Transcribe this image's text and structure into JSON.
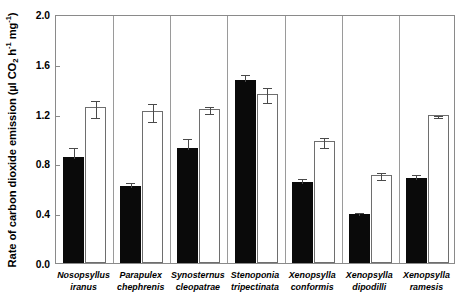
{
  "chart_data": {
    "type": "bar",
    "title": "",
    "xlabel": "",
    "ylabel": "Rate of carbon dioxide emission  (µl CO2 h-1 mg-1)",
    "ylabel_parts": {
      "prefix": "Rate of carbon dioxide emission  (",
      "mu": "µ",
      "l": "l CO",
      "sub2": "2",
      "h": " h",
      "sup1": "-1",
      "mg": " mg",
      "sup2": "-1",
      "suffix": ")"
    },
    "ylim": [
      0.0,
      2.0
    ],
    "yticks": [
      0.0,
      0.4,
      0.8,
      1.2,
      1.6,
      2.0
    ],
    "ytick_labels": [
      "0.0",
      "0.4",
      "0.8",
      "1.2",
      "1.6",
      "2.0"
    ],
    "grid": false,
    "legend": "none",
    "categories": [
      "Nosopsyllus iranus",
      "Parapulex chephrenis",
      "Synosternus cleopatrae",
      "Stenoponia tripectinata",
      "Xenopsylla conformis",
      "Xenopsylla dipodilli",
      "Xenopsylla ramesis"
    ],
    "category_lines": [
      [
        "Nosopsyllus",
        "iranus"
      ],
      [
        "Parapulex",
        "chephrenis"
      ],
      [
        "Synosternus",
        "cleopatrae"
      ],
      [
        "Stenoponia",
        "tripectinata"
      ],
      [
        "Xenopsylla",
        "conformis"
      ],
      [
        "Xenopsylla",
        "dipodilli"
      ],
      [
        "Xenopsylla",
        "ramesis"
      ]
    ],
    "series": [
      {
        "name": "filled",
        "fill": "#0a0a0a",
        "values": [
          0.85,
          0.62,
          0.92,
          1.47,
          0.65,
          0.39,
          0.68
        ],
        "errors": [
          0.09,
          0.04,
          0.09,
          0.06,
          0.04,
          0.03,
          0.04
        ]
      },
      {
        "name": "open",
        "fill": "#ffffff",
        "values": [
          1.25,
          1.22,
          1.24,
          1.36,
          0.98,
          0.71,
          1.19
        ],
        "errors": [
          0.07,
          0.07,
          0.03,
          0.06,
          0.04,
          0.03,
          0.01
        ]
      }
    ]
  },
  "colors": {
    "frame": "#8a8a8a",
    "filled_bar": "#0a0a0a",
    "open_bar_edge": "#6e6e6e",
    "error_bar": "#4a4a4a",
    "separator": "#9a9a9a",
    "text": "#000000",
    "background": "#ffffff"
  }
}
